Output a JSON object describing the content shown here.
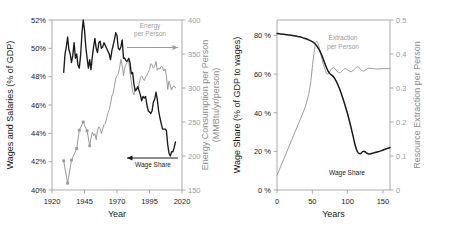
{
  "figure": {
    "background": "#ffffff",
    "panels": [
      "left",
      "right"
    ]
  },
  "colors": {
    "dark_series": "#1a1a1a",
    "light_series": "#9a9a9a",
    "axis": "#a0a0a0",
    "text_dark": "#1a1a1a",
    "text_gray": "#8c8c8c"
  },
  "chart_data": [
    {
      "panel": "left",
      "type": "line",
      "title": "",
      "xlabel": "Year",
      "ylabel": "Wages and Salaries (% of GDP)",
      "y2label": "Energy Consumption per Person\n(MMBtu/yr/person)",
      "xlim": [
        1920,
        2020
      ],
      "ylim": [
        40,
        52
      ],
      "y2lim": [
        150,
        400
      ],
      "xticks": [
        1920,
        1945,
        1970,
        1995,
        2020
      ],
      "xticklabels": [
        "1920",
        "1945",
        "1970",
        "1995",
        "2020"
      ],
      "yticks": [
        40,
        42,
        44,
        46,
        48,
        50,
        52
      ],
      "yticklabels": [
        "40%",
        "42%",
        "44%",
        "46%",
        "48%",
        "50%",
        "52%"
      ],
      "y2ticks": [
        150,
        200,
        250,
        300,
        350,
        400
      ],
      "y2ticklabels": [
        "150",
        "200",
        "250",
        "300",
        "350",
        "400"
      ],
      "grid": false,
      "annotations": [
        {
          "text": "Energy\nper Person",
          "series": "energy",
          "arrow": "right"
        },
        {
          "text": "Wage Share",
          "series": "wage",
          "arrow": "left"
        }
      ],
      "series": [
        {
          "name": "Wage Share",
          "axis": "left",
          "color": "#1a1a1a",
          "units": "% of GDP",
          "x": [
            1929,
            1930,
            1931,
            1932,
            1933,
            1934,
            1935,
            1936,
            1937,
            1938,
            1939,
            1940,
            1941,
            1942,
            1943,
            1944,
            1945,
            1946,
            1947,
            1948,
            1949,
            1950,
            1951,
            1952,
            1953,
            1954,
            1955,
            1956,
            1957,
            1958,
            1959,
            1960,
            1961,
            1962,
            1963,
            1964,
            1965,
            1966,
            1967,
            1968,
            1969,
            1970,
            1971,
            1972,
            1973,
            1974,
            1975,
            1976,
            1977,
            1978,
            1979,
            1980,
            1981,
            1982,
            1983,
            1984,
            1985,
            1986,
            1987,
            1988,
            1989,
            1990,
            1991,
            1992,
            1993,
            1994,
            1995,
            1996,
            1997,
            1998,
            1999,
            2000,
            2001,
            2002,
            2003,
            2004,
            2005,
            2006,
            2007,
            2008,
            2009,
            2010,
            2011,
            2012,
            2013,
            2014,
            2015
          ],
          "y": [
            48.3,
            49.6,
            50.1,
            50.8,
            49.9,
            49.6,
            49.0,
            49.5,
            50.4,
            49.3,
            49.6,
            48.8,
            48.6,
            49.5,
            51.0,
            52.0,
            51.3,
            50.1,
            49.3,
            48.6,
            49.2,
            48.5,
            49.4,
            50.1,
            50.7,
            50.0,
            49.7,
            50.4,
            50.5,
            50.0,
            50.1,
            50.4,
            50.2,
            50.0,
            49.8,
            49.6,
            49.2,
            49.8,
            50.2,
            50.6,
            51.1,
            50.9,
            50.0,
            49.9,
            50.1,
            50.6,
            49.3,
            49.3,
            49.1,
            49.1,
            49.3,
            49.0,
            48.2,
            48.3,
            47.5,
            47.0,
            47.1,
            47.3,
            47.0,
            46.7,
            46.3,
            46.6,
            46.5,
            46.6,
            46.0,
            45.6,
            45.5,
            45.4,
            45.6,
            46.2,
            46.4,
            46.9,
            46.4,
            45.6,
            45.1,
            44.7,
            44.3,
            44.3,
            44.3,
            44.2,
            43.2,
            42.6,
            42.4,
            42.7,
            42.7,
            43.0,
            43.4
          ]
        },
        {
          "name": "Energy per Person",
          "axis": "right",
          "color": "#9a9a9a",
          "units": "MMBtu/yr/person",
          "x": [
            1929,
            1932,
            1935,
            1939,
            1941,
            1944,
            1947,
            1949,
            1950,
            1951,
            1952,
            1953,
            1954,
            1955,
            1956,
            1957,
            1958,
            1959,
            1960,
            1961,
            1962,
            1963,
            1964,
            1965,
            1966,
            1967,
            1968,
            1969,
            1970,
            1971,
            1972,
            1973,
            1974,
            1975,
            1976,
            1977,
            1978,
            1979,
            1980,
            1981,
            1982,
            1983,
            1984,
            1985,
            1986,
            1987,
            1988,
            1989,
            1990,
            1991,
            1992,
            1993,
            1994,
            1995,
            1996,
            1997,
            1998,
            1999,
            2000,
            2001,
            2002,
            2003,
            2004,
            2005,
            2006,
            2007,
            2008,
            2009,
            2010,
            2011,
            2012,
            2013,
            2014,
            2015
          ],
          "y": [
            193,
            160,
            194,
            211,
            238,
            250,
            237,
            215,
            226,
            235,
            230,
            233,
            224,
            238,
            243,
            240,
            233,
            240,
            246,
            248,
            255,
            263,
            268,
            276,
            288,
            292,
            302,
            314,
            318,
            321,
            330,
            342,
            333,
            318,
            331,
            335,
            338,
            340,
            322,
            310,
            295,
            290,
            300,
            298,
            300,
            306,
            315,
            318,
            314,
            311,
            316,
            319,
            323,
            327,
            336,
            334,
            329,
            332,
            339,
            326,
            329,
            328,
            332,
            331,
            325,
            328,
            318,
            298,
            310,
            304,
            297,
            302,
            303,
            300
          ]
        }
      ]
    },
    {
      "panel": "right",
      "type": "line",
      "title": "",
      "xlabel": "Years",
      "ylabel": "Wage Share (% of GDP to wages)",
      "y2label": "Resource Extraction per Person",
      "xlim": [
        0,
        160
      ],
      "ylim": [
        0,
        88
      ],
      "y2lim": [
        0,
        0.5
      ],
      "xticks": [
        0,
        50,
        100,
        150
      ],
      "xticklabels": [
        "0",
        "50",
        "100",
        "150"
      ],
      "yticks": [
        0,
        20,
        40,
        60,
        80
      ],
      "yticklabels": [
        "0 %",
        "20 %",
        "40 %",
        "60 %",
        "80 %"
      ],
      "y2ticks": [
        0,
        0.1,
        0.2,
        0.3,
        0.4,
        0.5
      ],
      "y2ticklabels": [
        "0",
        "0.1",
        "0.2",
        "0.3",
        "0.4",
        "0.5"
      ],
      "grid": false,
      "annotations": [
        {
          "text": "Extraction\nper Person",
          "series": "extraction"
        },
        {
          "text": "Wage Share",
          "series": "wage"
        }
      ],
      "series": [
        {
          "name": "Wage Share",
          "axis": "left",
          "color": "#1a1a1a",
          "units": "% of GDP to wages",
          "x": [
            0,
            5,
            10,
            15,
            20,
            25,
            30,
            35,
            40,
            45,
            50,
            53,
            56,
            58,
            60,
            62,
            64,
            66,
            68,
            70,
            72,
            74,
            76,
            78,
            80,
            82,
            85,
            88,
            90,
            93,
            96,
            99,
            102,
            105,
            108,
            110,
            112,
            114,
            116,
            118,
            120,
            122,
            124,
            126,
            128,
            130,
            133,
            136,
            139,
            142,
            145,
            148,
            151,
            154,
            157,
            160
          ],
          "y": [
            81.0,
            80.8,
            80.6,
            80.4,
            80.1,
            79.8,
            79.4,
            79.0,
            78.4,
            77.7,
            76.8,
            76.0,
            74.8,
            73.6,
            72.4,
            70.9,
            69.2,
            67.3,
            65.3,
            63.4,
            61.8,
            60.6,
            59.8,
            59.3,
            58.6,
            57.5,
            55.4,
            52.9,
            51.0,
            47.8,
            44.3,
            40.6,
            36.5,
            32.1,
            27.4,
            24.2,
            21.6,
            19.8,
            18.9,
            18.8,
            19.4,
            20.0,
            19.9,
            19.4,
            18.9,
            18.7,
            18.8,
            19.1,
            19.4,
            19.7,
            20.0,
            20.4,
            20.8,
            21.2,
            21.6,
            22.0
          ]
        },
        {
          "name": "Extraction per Person",
          "axis": "right",
          "color": "#9a9a9a",
          "units": "resource units per person",
          "x": [
            0,
            5,
            10,
            15,
            20,
            25,
            30,
            35,
            40,
            45,
            48,
            50,
            52,
            54,
            56,
            58,
            60,
            62,
            64,
            66,
            68,
            70,
            72,
            74,
            76,
            78,
            80,
            82,
            84,
            86,
            88,
            90,
            92,
            94,
            96,
            98,
            100,
            102,
            104,
            106,
            108,
            110,
            112,
            114,
            116,
            118,
            120,
            122,
            124,
            126,
            128,
            130,
            133,
            136,
            140,
            145,
            150,
            155,
            160
          ],
          "y": [
            0.043,
            0.068,
            0.093,
            0.118,
            0.143,
            0.168,
            0.193,
            0.218,
            0.245,
            0.283,
            0.322,
            0.36,
            0.397,
            0.425,
            0.437,
            0.432,
            0.417,
            0.399,
            0.383,
            0.368,
            0.354,
            0.344,
            0.341,
            0.346,
            0.353,
            0.358,
            0.36,
            0.357,
            0.352,
            0.347,
            0.345,
            0.346,
            0.35,
            0.354,
            0.357,
            0.356,
            0.353,
            0.35,
            0.348,
            0.349,
            0.352,
            0.356,
            0.36,
            0.362,
            0.36,
            0.356,
            0.352,
            0.35,
            0.351,
            0.354,
            0.357,
            0.358,
            0.358,
            0.357,
            0.356,
            0.356,
            0.357,
            0.357,
            0.357
          ]
        }
      ]
    }
  ]
}
